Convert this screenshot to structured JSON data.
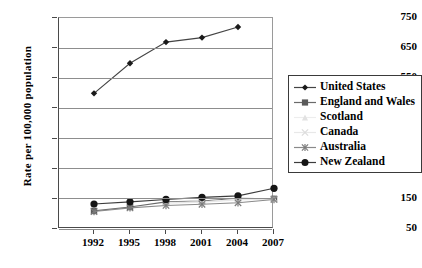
{
  "axes": {
    "ylabel": "Rate per 100,000 population",
    "xlabel": "",
    "yticks": [
      "750",
      "650",
      "550",
      "450",
      "350",
      "250",
      "150",
      "50"
    ],
    "xticks": [
      "1992",
      "1995",
      "1998",
      "2001",
      "2004",
      "2007"
    ]
  },
  "legend": {
    "items": [
      {
        "label": "United States",
        "marker": "diamond-marker",
        "color": "#1a1a1a",
        "line": "#444444"
      },
      {
        "label": "England and Wales",
        "marker": "square-marker",
        "color": "#5a5a5a",
        "line": "#6a6a6a"
      },
      {
        "label": "Scotland",
        "marker": "triangle-marker",
        "color": "#e2e2e2",
        "line": "#ededed"
      },
      {
        "label": "Canada",
        "marker": "cross-marker",
        "color": "#dcdcdc",
        "line": "#e8e8e8"
      },
      {
        "label": "Australia",
        "marker": "asterisk-marker",
        "color": "#7b7b7b",
        "line": "#8a8a8a"
      },
      {
        "label": "New Zealand",
        "marker": "circle-marker",
        "color": "#151515",
        "line": "#3c3c3c"
      }
    ]
  },
  "chart_data": {
    "type": "line",
    "title": "",
    "xlabel": "",
    "ylabel": "Rate per 100,000 population",
    "x": [
      1992,
      1995,
      1998,
      2001,
      2004,
      2007
    ],
    "categories": [
      "1992",
      "1995",
      "1998",
      "2001",
      "2004",
      "2007"
    ],
    "ylim": [
      50,
      750
    ],
    "ytick_step": 100,
    "grid": true,
    "legend_position": "right",
    "series": [
      {
        "name": "United States",
        "values": [
          500,
          600,
          670,
          685,
          720,
          null
        ]
      },
      {
        "name": "England and Wales",
        "values": [
          110,
          123,
          140,
          143,
          152,
          150
        ]
      },
      {
        "name": "Scotland",
        "values": [
          null,
          null,
          138,
          140,
          148,
          150
        ]
      },
      {
        "name": "Canada",
        "values": [
          null,
          null,
          136,
          139,
          146,
          149
        ]
      },
      {
        "name": "Australia",
        "values": [
          108,
          120,
          128,
          132,
          137,
          148
        ]
      },
      {
        "name": "New Zealand",
        "values": [
          133,
          140,
          148,
          155,
          160,
          185
        ]
      }
    ]
  }
}
